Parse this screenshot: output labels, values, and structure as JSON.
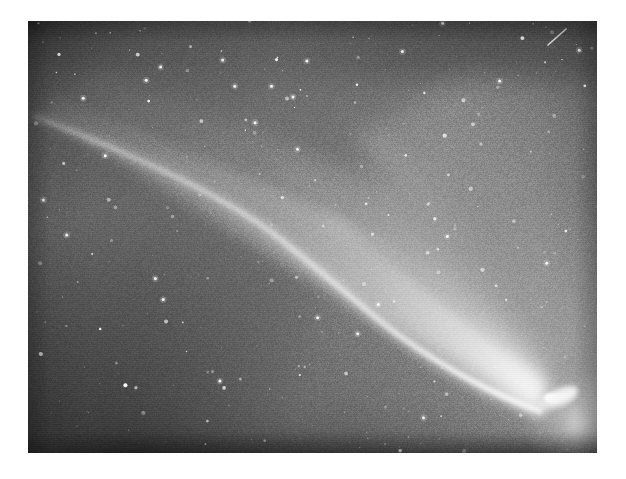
{
  "page": {
    "background_color": "#ffffff",
    "width": 626,
    "height": 479
  },
  "photo": {
    "subject": "comet",
    "kind": "astronomical photograph",
    "medium": "black-and-white photographic plate",
    "frame": {
      "left": 28,
      "top": 21,
      "width": 569,
      "height": 432
    },
    "sky_background_color": "#5e5e5e",
    "dark_corner_color": "#3a3a3a",
    "highlight_color": "#ffffff",
    "border_color": "#ffffff",
    "features": [
      {
        "name": "comet-nucleus",
        "label": "Nucleus / coma",
        "x": 545,
        "y": 399,
        "brightness": "saturated white",
        "description": "Bright elongated teardrop core at lower right of frame"
      },
      {
        "name": "ion-tail",
        "label": "Ion tail",
        "description": "Narrow, sharply bounded bright streak running from the nucleus up toward the upper-left corner",
        "from_x": 540,
        "from_y": 396,
        "to_x": 45,
        "to_y": 118,
        "angle_deg": -29
      },
      {
        "name": "dust-tail",
        "label": "Dust tail",
        "description": "Broad diffuse fan of light spreading upward and to the right of the ion tail",
        "angle_deg": -27
      },
      {
        "name": "star-field",
        "label": "Star field",
        "description": "Hundreds of point-like stars scattered across the whole plate",
        "star_count": 420
      },
      {
        "name": "satellite-streak",
        "label": "Streak",
        "description": "Short diagonal trail near the top-right corner",
        "x1": 548,
        "y1": 45,
        "x2": 566,
        "y2": 29
      }
    ]
  },
  "chart_data": {
    "type": "scatter",
    "title": "",
    "xlabel": "",
    "ylabel": ""
  }
}
